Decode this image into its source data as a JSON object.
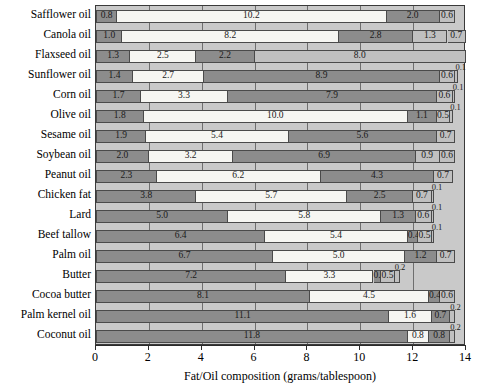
{
  "chart_data": {
    "type": "bar",
    "orientation": "horizontal",
    "stacked": true,
    "title": "",
    "xlabel": "Fat/Oil composition (grams/tablespoon)",
    "ylabel": "",
    "xlim": [
      0,
      14
    ],
    "xticks": [
      0,
      2,
      4,
      6,
      8,
      10,
      12,
      14
    ],
    "grid": true,
    "grid_axis": "x",
    "legend": null,
    "categories": [
      "Safflower oil",
      "Canola oil",
      "Flaxseed oil",
      "Sunflower oil",
      "Corn oil",
      "Olive oil",
      "Sesame oil",
      "Soybean oil",
      "Peanut oil",
      "Chicken fat",
      "Lard",
      "Beef tallow",
      "Palm oil",
      "Butter",
      "Cocoa butter",
      "Palm kernel oil",
      "Coconut oil"
    ],
    "segment_styles": [
      "dark",
      "white",
      "medium",
      "light",
      "light"
    ],
    "rows": [
      {
        "category": "Safflower oil",
        "segments": [
          {
            "value": 0.8,
            "label": "0.8",
            "style": "dark",
            "label_pos": "inside"
          },
          {
            "value": 10.2,
            "label": "10.2",
            "style": "white",
            "label_pos": "inside"
          },
          {
            "value": 2.0,
            "label": "2.0",
            "style": "medium",
            "label_pos": "inside"
          },
          {
            "value": 0.6,
            "label": "0.6",
            "style": "light",
            "label_pos": "inside"
          }
        ]
      },
      {
        "category": "Canola oil",
        "segments": [
          {
            "value": 1.0,
            "label": "1.0",
            "style": "dark",
            "label_pos": "inside"
          },
          {
            "value": 8.2,
            "label": "8.2",
            "style": "white",
            "label_pos": "inside"
          },
          {
            "value": 2.8,
            "label": "2.8",
            "style": "medium",
            "label_pos": "inside"
          },
          {
            "value": 1.3,
            "label": "1.3",
            "style": "light",
            "label_pos": "inside"
          },
          {
            "value": 0.7,
            "label": "0.7",
            "style": "light",
            "label_pos": "inside"
          }
        ]
      },
      {
        "category": "Flaxseed oil",
        "segments": [
          {
            "value": 1.3,
            "label": "1.3",
            "style": "dark",
            "label_pos": "inside"
          },
          {
            "value": 2.5,
            "label": "2.5",
            "style": "white",
            "label_pos": "inside"
          },
          {
            "value": 2.2,
            "label": "2.2",
            "style": "medium",
            "label_pos": "inside"
          },
          {
            "value": 8.0,
            "label": "8.0",
            "style": "light",
            "label_pos": "inside"
          }
        ]
      },
      {
        "category": "Sunflower oil",
        "segments": [
          {
            "value": 1.4,
            "label": "1.4",
            "style": "dark",
            "label_pos": "inside"
          },
          {
            "value": 2.7,
            "label": "2.7",
            "style": "white",
            "label_pos": "inside"
          },
          {
            "value": 8.9,
            "label": "8.9",
            "style": "medium",
            "label_pos": "inside"
          },
          {
            "value": 0.6,
            "label": "0.6",
            "style": "light",
            "label_pos": "inside"
          },
          {
            "value": 0.1,
            "label": "0.1",
            "style": "light",
            "label_pos": "above"
          }
        ]
      },
      {
        "category": "Corn oil",
        "segments": [
          {
            "value": 1.7,
            "label": "1.7",
            "style": "dark",
            "label_pos": "inside"
          },
          {
            "value": 3.3,
            "label": "3.3",
            "style": "white",
            "label_pos": "inside"
          },
          {
            "value": 7.9,
            "label": "7.9",
            "style": "medium",
            "label_pos": "inside"
          },
          {
            "value": 0.6,
            "label": "0.6",
            "style": "light",
            "label_pos": "inside"
          },
          {
            "value": 0.1,
            "label": "0.1",
            "style": "light",
            "label_pos": "above"
          }
        ]
      },
      {
        "category": "Olive oil",
        "segments": [
          {
            "value": 1.8,
            "label": "1.8",
            "style": "dark",
            "label_pos": "inside"
          },
          {
            "value": 10.0,
            "label": "10.0",
            "style": "white",
            "label_pos": "inside"
          },
          {
            "value": 1.1,
            "label": "1.1",
            "style": "medium",
            "label_pos": "inside"
          },
          {
            "value": 0.5,
            "label": "0.5",
            "style": "light",
            "label_pos": "inside"
          },
          {
            "value": 0.1,
            "label": "0.1",
            "style": "light",
            "label_pos": "above"
          }
        ]
      },
      {
        "category": "Sesame oil",
        "segments": [
          {
            "value": 1.9,
            "label": "1.9",
            "style": "dark",
            "label_pos": "inside"
          },
          {
            "value": 5.4,
            "label": "5.4",
            "style": "white",
            "label_pos": "inside"
          },
          {
            "value": 5.6,
            "label": "5.6",
            "style": "medium",
            "label_pos": "inside"
          },
          {
            "value": 0.7,
            "label": "0.7",
            "style": "light",
            "label_pos": "inside"
          }
        ]
      },
      {
        "category": "Soybean oil",
        "segments": [
          {
            "value": 2.0,
            "label": "2.0",
            "style": "dark",
            "label_pos": "inside"
          },
          {
            "value": 3.2,
            "label": "3.2",
            "style": "white",
            "label_pos": "inside"
          },
          {
            "value": 6.9,
            "label": "6.9",
            "style": "medium",
            "label_pos": "inside"
          },
          {
            "value": 0.9,
            "label": "0.9",
            "style": "light",
            "label_pos": "inside"
          },
          {
            "value": 0.6,
            "label": "0.6",
            "style": "light",
            "label_pos": "inside"
          }
        ]
      },
      {
        "category": "Peanut oil",
        "segments": [
          {
            "value": 2.3,
            "label": "2.3",
            "style": "dark",
            "label_pos": "inside"
          },
          {
            "value": 6.2,
            "label": "6.2",
            "style": "white",
            "label_pos": "inside"
          },
          {
            "value": 4.3,
            "label": "4.3",
            "style": "medium",
            "label_pos": "inside"
          },
          {
            "value": 0.7,
            "label": "0.7",
            "style": "light",
            "label_pos": "inside"
          }
        ]
      },
      {
        "category": "Chicken fat",
        "segments": [
          {
            "value": 3.8,
            "label": "3.8",
            "style": "dark",
            "label_pos": "inside"
          },
          {
            "value": 5.7,
            "label": "5.7",
            "style": "white",
            "label_pos": "inside"
          },
          {
            "value": 2.5,
            "label": "2.5",
            "style": "medium",
            "label_pos": "inside"
          },
          {
            "value": 0.7,
            "label": "0.7",
            "style": "light",
            "label_pos": "inside"
          },
          {
            "value": 0.1,
            "label": "0.1",
            "style": "light",
            "label_pos": "above"
          }
        ]
      },
      {
        "category": "Lard",
        "segments": [
          {
            "value": 5.0,
            "label": "5.0",
            "style": "dark",
            "label_pos": "inside"
          },
          {
            "value": 5.8,
            "label": "5.8",
            "style": "white",
            "label_pos": "inside"
          },
          {
            "value": 1.3,
            "label": "1.3",
            "style": "medium",
            "label_pos": "inside"
          },
          {
            "value": 0.6,
            "label": "0.6",
            "style": "light",
            "label_pos": "inside"
          },
          {
            "value": 0.1,
            "label": "0.1",
            "style": "light",
            "label_pos": "above"
          }
        ]
      },
      {
        "category": "Beef tallow",
        "segments": [
          {
            "value": 6.4,
            "label": "6.4",
            "style": "dark",
            "label_pos": "inside"
          },
          {
            "value": 5.4,
            "label": "5.4",
            "style": "white",
            "label_pos": "inside"
          },
          {
            "value": 0.4,
            "label": "0.4",
            "style": "medium",
            "label_pos": "inside"
          },
          {
            "value": 0.5,
            "label": "0.5",
            "style": "light",
            "label_pos": "inside"
          },
          {
            "value": 0.1,
            "label": "0.1",
            "style": "light",
            "label_pos": "above"
          }
        ]
      },
      {
        "category": "Palm oil",
        "segments": [
          {
            "value": 6.7,
            "label": "6.7",
            "style": "dark",
            "label_pos": "inside"
          },
          {
            "value": 5.0,
            "label": "5.0",
            "style": "white",
            "label_pos": "inside"
          },
          {
            "value": 1.2,
            "label": "1.2",
            "style": "medium",
            "label_pos": "inside"
          },
          {
            "value": 0.7,
            "label": "0.7",
            "style": "light",
            "label_pos": "inside"
          }
        ]
      },
      {
        "category": "Butter",
        "segments": [
          {
            "value": 7.2,
            "label": "7.2",
            "style": "dark",
            "label_pos": "inside"
          },
          {
            "value": 3.3,
            "label": "3.3",
            "style": "white",
            "label_pos": "inside"
          },
          {
            "value": 0.3,
            "label": "0.3",
            "style": "medium",
            "label_pos": "inside"
          },
          {
            "value": 0.5,
            "label": "0.5",
            "style": "light",
            "label_pos": "inside"
          },
          {
            "value": 0.2,
            "label": "0.2",
            "style": "light",
            "label_pos": "above"
          }
        ]
      },
      {
        "category": "Cocoa butter",
        "segments": [
          {
            "value": 8.1,
            "label": "8.1",
            "style": "dark",
            "label_pos": "inside"
          },
          {
            "value": 4.5,
            "label": "4.5",
            "style": "white",
            "label_pos": "inside"
          },
          {
            "value": 0.4,
            "label": "0.4",
            "style": "medium",
            "label_pos": "inside"
          },
          {
            "value": 0.6,
            "label": "0.6",
            "style": "light",
            "label_pos": "inside"
          }
        ]
      },
      {
        "category": "Palm kernel oil",
        "segments": [
          {
            "value": 11.1,
            "label": "11.1",
            "style": "dark",
            "label_pos": "inside"
          },
          {
            "value": 1.6,
            "label": "1.6",
            "style": "white",
            "label_pos": "inside"
          },
          {
            "value": 0.7,
            "label": "0.7",
            "style": "medium",
            "label_pos": "inside"
          },
          {
            "value": 0.2,
            "label": "0.2",
            "style": "light",
            "label_pos": "above"
          }
        ]
      },
      {
        "category": "Coconut oil",
        "segments": [
          {
            "value": 11.8,
            "label": "11.8",
            "style": "dark",
            "label_pos": "inside"
          },
          {
            "value": 0.8,
            "label": "0.8",
            "style": "white",
            "label_pos": "inside"
          },
          {
            "value": 0.8,
            "label": "0.8",
            "style": "medium",
            "label_pos": "inside"
          },
          {
            "value": 0.2,
            "label": "0.2",
            "style": "light",
            "label_pos": "above"
          }
        ]
      }
    ]
  },
  "colors": {
    "plot_background": "#c9c9c9",
    "segment_dark": "#8c8c8c",
    "segment_white": "#f6f6f2",
    "segment_medium": "#8c8c8c",
    "segment_light": "#c0c0c0",
    "gridline": "#6e6e6e",
    "axis": "#2b2b2b"
  }
}
